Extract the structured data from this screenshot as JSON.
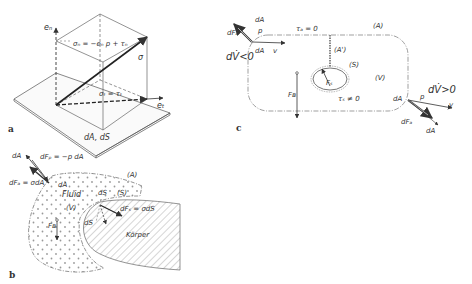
{
  "figure": {
    "panels": [
      {
        "id": "a",
        "label": "a",
        "description": "Stress vector decomposition on surface element",
        "labels": {
          "normal_unit": "eₙ",
          "tangent_unit": "eₜ",
          "normal_stress": "σₙ = −eₙ p + τₙ",
          "stress": "σ",
          "tangential_stress": "σₜ = τₜ",
          "area": "dA, dS"
        }
      },
      {
        "id": "b",
        "label": "b",
        "description": "Fluid volume with body surface",
        "labels": {
          "dA_arrow": "dA",
          "pressure_force": "dFₚ = −p dA",
          "surface_force": "dFₐ = σdA",
          "dA_surface": "dA",
          "region_A": "(A)",
          "fluid": "Fluid",
          "volume": "(V)",
          "dS_top": "dS",
          "region_S": "(S)",
          "body_force_on_surface": "dFₛ = σdS",
          "dS_bottom": "dS",
          "gravity": "Fʙ",
          "body": "Körper"
        }
      },
      {
        "id": "c",
        "label": "c",
        "description": "Control volume with inflow and outflow",
        "labels": {
          "inflow_force": "dFₐ",
          "inflow_dA": "dA",
          "inflow_p": "p",
          "inflow_dA2": "dA",
          "inflow_v": "v",
          "inflow_condition": "dV̇<0",
          "tau_A": "τₐ = 0",
          "region_A": "(A)",
          "region_A_prime": "(A')",
          "region_S": "(S)",
          "force_S": "Fₛ",
          "volume": "(V)",
          "gravity": "Fʙ",
          "tau_S": "τₛ ≠ 0",
          "outflow_dA": "dA",
          "outflow_p": "p",
          "outflow_condition": "dV̇>0",
          "outflow_v": "v",
          "outflow_force": "dFₐ",
          "outflow_dA2": "dA"
        }
      }
    ]
  },
  "colors": {
    "ink": "#333333",
    "background": "#ffffff",
    "light_ink": "#777777"
  }
}
